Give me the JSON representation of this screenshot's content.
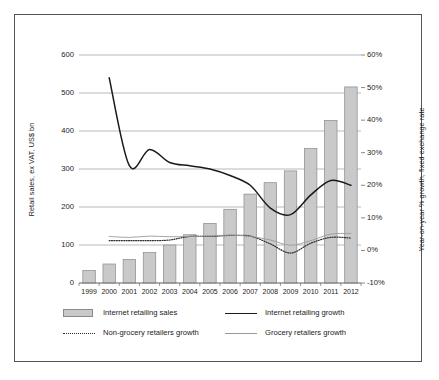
{
  "chart_data": {
    "type": "bar",
    "title": "",
    "subtitle": "",
    "xlabel": "",
    "ylabel": "Retail sales, ex VAT, US$ bn",
    "y2label": "Year-on-year % growth, fixed exchange rate",
    "categories": [
      "1999",
      "2000",
      "2001",
      "2002",
      "2003",
      "2004",
      "2005",
      "2006",
      "2007",
      "2008",
      "2009",
      "2010",
      "2011",
      "2012"
    ],
    "ylim": [
      0,
      600
    ],
    "y2lim": [
      -10,
      60
    ],
    "yticks": [
      "0",
      "100",
      "200",
      "300",
      "400",
      "500",
      "600"
    ],
    "y2ticks": [
      "-10%",
      "0%",
      "10%",
      "20%",
      "30%",
      "40%",
      "50%",
      "60%"
    ],
    "grid": true,
    "legend_position": "bottom",
    "series": [
      {
        "name": "Internet retailing sales",
        "type": "bar",
        "axis": "left",
        "unit": "US$ bn",
        "color": "#c9c9c9",
        "edge_color": "#8a8a8a",
        "values": [
          33,
          50,
          62,
          80,
          100,
          127,
          157,
          194,
          234,
          264,
          295,
          354,
          428,
          516
        ]
      },
      {
        "name": "Internet retailing growth",
        "type": "line",
        "axis": "right",
        "unit": "%",
        "color": "#1a1a1a",
        "style": "solid",
        "values": [
          null,
          53.0,
          26.0,
          31.0,
          27.0,
          26.0,
          25.0,
          23.0,
          20.0,
          13.0,
          11.0,
          17.0,
          21.5,
          20.0
        ]
      },
      {
        "name": "Non-grocery retailers growth",
        "type": "line",
        "axis": "right",
        "unit": "%",
        "color": "#333333",
        "style": "dotted",
        "values": [
          null,
          3.0,
          3.0,
          3.0,
          3.2,
          4.3,
          4.3,
          4.6,
          4.4,
          2.0,
          -0.8,
          2.2,
          4.0,
          3.8
        ]
      },
      {
        "name": "Grocery retailers growth",
        "type": "line",
        "axis": "right",
        "unit": "%",
        "color": "#9a9a9a",
        "style": "solid-thin",
        "values": [
          null,
          4.3,
          4.0,
          4.4,
          4.2,
          4.3,
          4.4,
          4.7,
          4.3,
          3.2,
          1.6,
          3.0,
          5.0,
          5.2
        ]
      }
    ]
  },
  "legend": {
    "items": [
      {
        "label": "Internet retailing sales",
        "marker": "bar-swatch"
      },
      {
        "label": "Internet retailing growth",
        "marker": "solid-line"
      },
      {
        "label": "Non-grocery retailers growth",
        "marker": "dotted-line"
      },
      {
        "label": "Grocery retailers growth",
        "marker": "grey-line"
      }
    ]
  }
}
